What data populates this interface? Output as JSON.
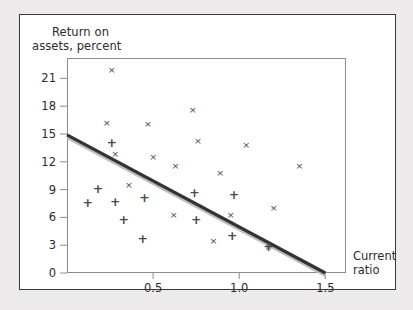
{
  "figure": {
    "y_axis_title_line1": "Return on",
    "y_axis_title_line2": "assets, percent",
    "x_axis_title_line1": "Current",
    "x_axis_title_line2": "ratio"
  },
  "chart_data": {
    "type": "scatter",
    "title": "",
    "xlabel": "Current ratio",
    "ylabel": "Return on assets, percent",
    "xlim": [
      0,
      1.62
    ],
    "ylim": [
      0,
      23.2
    ],
    "xticks": [
      0.5,
      1.0,
      1.5
    ],
    "xticklabels": [
      "0.5",
      "1.0",
      "1.5"
    ],
    "yticks": [
      0,
      3,
      6,
      9,
      12,
      15,
      18,
      21
    ],
    "yticklabels": [
      "0",
      "3",
      "6",
      "9",
      "12",
      "15",
      "18",
      "21"
    ],
    "grid": false,
    "legend": "none",
    "series": [
      {
        "name": "group-x",
        "marker": "x",
        "color": "#4a4a4a",
        "points": [
          [
            0.26,
            22.0
          ],
          [
            0.23,
            16.2
          ],
          [
            0.28,
            12.9
          ],
          [
            0.47,
            16.1
          ],
          [
            0.73,
            17.6
          ],
          [
            0.5,
            12.6
          ],
          [
            0.63,
            11.6
          ],
          [
            0.76,
            14.3
          ],
          [
            1.04,
            13.9
          ],
          [
            1.35,
            11.6
          ],
          [
            0.89,
            10.8
          ],
          [
            0.36,
            9.5
          ],
          [
            0.62,
            6.3
          ],
          [
            0.95,
            6.3
          ],
          [
            1.2,
            7.1
          ],
          [
            0.85,
            3.5
          ],
          [
            1.17,
            2.9
          ]
        ]
      },
      {
        "name": "group-plus",
        "marker": "+",
        "color": "#4a4a4a",
        "points": [
          [
            0.26,
            14.1
          ],
          [
            0.18,
            9.1
          ],
          [
            0.12,
            7.6
          ],
          [
            0.28,
            7.7
          ],
          [
            0.45,
            8.2
          ],
          [
            0.33,
            5.8
          ],
          [
            0.44,
            3.7
          ],
          [
            0.74,
            8.7
          ],
          [
            0.97,
            8.5
          ],
          [
            0.75,
            5.8
          ],
          [
            0.96,
            4.0
          ],
          [
            1.17,
            2.9
          ]
        ]
      }
    ],
    "trendline": {
      "name": "regression-line",
      "color": "#333333",
      "x_start": 0.0,
      "y_start": 14.9,
      "x_end": 1.5,
      "y_end": 0.0
    }
  }
}
